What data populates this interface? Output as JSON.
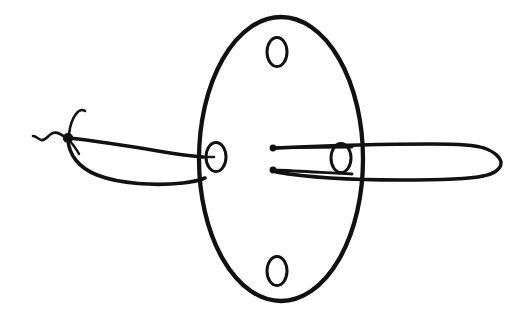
{
  "document": {
    "kind": "hand-drawn ink line drawing",
    "medium": "black ink on white paper",
    "background_color": "#ffffff",
    "ink_color": "#111111",
    "canvas": {
      "width": 528,
      "height": 319
    },
    "caption": "",
    "labels": []
  },
  "drawing": {
    "title": "",
    "subject": "flattened oval body with left tapered appendage and right tubular appendage",
    "parts": [
      {
        "id": "central-ellipse",
        "name": "central-ellipse",
        "description": "large vertical ellipse forming the body",
        "cx": 281,
        "cy": 159,
        "rx": 82,
        "ry": 142,
        "stroke_width": 4.2
      },
      {
        "id": "oval-top",
        "name": "oval-opening-top",
        "description": "small oval opening near top of the body",
        "cx": 277,
        "cy": 52,
        "rx": 10,
        "ry": 14,
        "stroke_width": 3
      },
      {
        "id": "oval-left",
        "name": "oval-opening-left",
        "description": "small oval opening on left of the body midline",
        "cx": 216,
        "cy": 157,
        "rx": 10,
        "ry": 14,
        "stroke_width": 3
      },
      {
        "id": "oval-right",
        "name": "oval-opening-right",
        "description": "small oval opening on right of the body midline",
        "cx": 341,
        "cy": 158,
        "rx": 10,
        "ry": 14,
        "stroke_width": 3
      },
      {
        "id": "oval-bottom",
        "name": "oval-opening-bottom",
        "description": "small oval opening near bottom of the body",
        "cx": 277,
        "cy": 271,
        "rx": 10,
        "ry": 14,
        "stroke_width": 3
      },
      {
        "id": "left-appendage",
        "name": "left-tapered-appendage",
        "description": "leaf-shaped tapering appendage extending left from the body",
        "tip_x": 68,
        "tip_y": 137,
        "base_x": 200,
        "stroke_width": 3.4
      },
      {
        "id": "left-knot",
        "name": "left-tip-knot",
        "description": "dark ink blob at the narrow tip of the left appendage",
        "cx": 68,
        "cy": 137,
        "r": 5
      },
      {
        "id": "left-tendril",
        "name": "left-wavy-tendril",
        "description": "short wavy squiggle extending left from the knot"
      },
      {
        "id": "left-hook",
        "name": "left-upward-hook",
        "description": "thin hooked line curving up and right from the knot"
      },
      {
        "id": "right-appendage",
        "name": "right-tubular-appendage",
        "description": "long tube with rounded cap extending right from the body",
        "start_x": 272,
        "end_x": 501,
        "top_y": 146,
        "bottom_y": 176,
        "stroke_width": 3.4
      },
      {
        "id": "inner-line-upper",
        "name": "inner-line-upper",
        "description": "upper horizontal line with round dot terminal inside the body",
        "dot_x": 273,
        "dot_y": 148
      },
      {
        "id": "inner-line-lower",
        "name": "inner-line-lower",
        "description": "lower horizontal line with round dot terminal inside the body",
        "dot_x": 273,
        "dot_y": 170
      }
    ]
  }
}
